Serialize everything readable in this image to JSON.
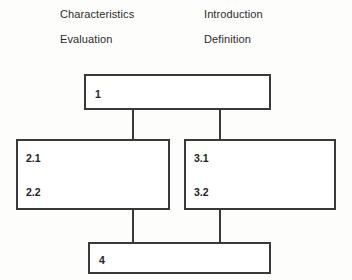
{
  "diagram": {
    "type": "block-flow-diagram",
    "background_color": "#fdfdfc",
    "line_color": "#393939",
    "text_color": "#2b2b2b",
    "legend": {
      "column_left": [
        {
          "label": "Characteristics"
        },
        {
          "label": "Evaluation"
        }
      ],
      "column_right": [
        {
          "label": "Introduction"
        },
        {
          "label": "Definition"
        }
      ]
    },
    "nodes": [
      {
        "id": "node-1",
        "labels": [
          "1"
        ]
      },
      {
        "id": "node-2",
        "labels": [
          "2.1",
          "2.2"
        ]
      },
      {
        "id": "node-3",
        "labels": [
          "3.1",
          "3.2"
        ]
      },
      {
        "id": "node-4",
        "labels": [
          "4"
        ]
      }
    ],
    "edges": [
      {
        "from": "node-1",
        "to": "node-2"
      },
      {
        "from": "node-1",
        "to": "node-3"
      },
      {
        "from": "node-2",
        "to": "node-4"
      },
      {
        "from": "node-3",
        "to": "node-4"
      }
    ]
  }
}
